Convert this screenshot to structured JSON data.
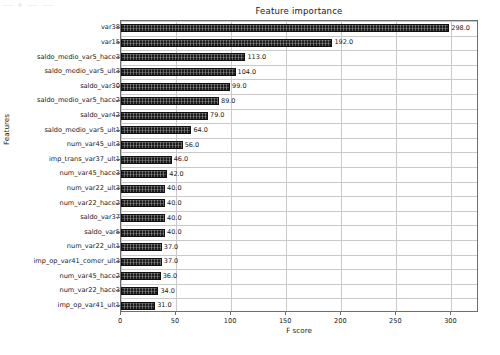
{
  "chart_data": {
    "type": "bar",
    "orientation": "horizontal",
    "title": "Feature importance",
    "xlabel": "F score",
    "ylabel": "Features",
    "xlim": [
      0,
      325
    ],
    "ylim": [
      0,
      19
    ],
    "grid": true,
    "legend": null,
    "xticks": [
      0,
      50,
      100,
      150,
      200,
      250,
      300
    ],
    "xtick_labels": [
      "0",
      "50",
      "100",
      "150",
      "200",
      "250",
      "300"
    ],
    "categories": [
      "var38",
      "var15",
      "saldo_medio_var5_hace3",
      "saldo_medio_var5_ult3",
      "saldo_var30",
      "saldo_medio_var5_hace2",
      "saldo_var42",
      "saldo_medio_var5_ult1",
      "num_var45_ult3",
      "imp_trans_var37_ult1",
      "num_var45_hace3",
      "num_var22_ult3",
      "num_var22_hace2",
      "saldo_var37",
      "saldo_var5",
      "num_var22_ult1",
      "imp_op_var41_comer_ult3",
      "num_var45_hace2",
      "num_var22_hace3",
      "imp_op_var41_ult1"
    ],
    "values": [
      298,
      192,
      113,
      104,
      99,
      89,
      79,
      64,
      56,
      46,
      42,
      40,
      40,
      40,
      40,
      37,
      37,
      36,
      34,
      31
    ],
    "value_labels": [
      "298.0",
      "192.0",
      "113.0",
      "104.0",
      "99.0",
      "89.0",
      "79.0",
      "64.0",
      "56.0",
      "46.0",
      "42.0",
      "40.0",
      "40.0",
      "40.0",
      "40.0",
      "37.0",
      "37.0",
      "36.0",
      "34.0",
      "31.0"
    ],
    "colors": {
      "bar": "#1c1c1c",
      "grid": "#c9c9c9",
      "axis": "#6e6e6e",
      "text": "#1a1a1a",
      "background": "#ffffff"
    }
  }
}
